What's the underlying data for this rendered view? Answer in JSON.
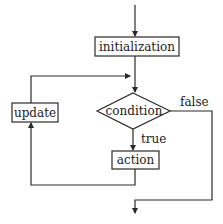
{
  "diagram": {
    "type": "flowchart",
    "colors": {
      "stroke": "#2a2a2a",
      "text": "#222222",
      "background": "#ffffff"
    },
    "nodes": {
      "initialization": {
        "label": "initialization",
        "shape": "rectangle"
      },
      "condition": {
        "label": "condition",
        "shape": "diamond"
      },
      "action": {
        "label": "action",
        "shape": "rectangle"
      },
      "update": {
        "label": "update",
        "shape": "rectangle"
      }
    },
    "edges": [
      {
        "from": "start",
        "to": "initialization",
        "label": ""
      },
      {
        "from": "initialization",
        "to": "condition",
        "label": ""
      },
      {
        "from": "condition",
        "to": "action",
        "label": "true"
      },
      {
        "from": "action",
        "to": "update",
        "label": ""
      },
      {
        "from": "update",
        "to": "condition",
        "label": ""
      },
      {
        "from": "condition",
        "to": "end",
        "label": "false"
      }
    ],
    "edge_labels": {
      "true": "true",
      "false": "false"
    }
  }
}
